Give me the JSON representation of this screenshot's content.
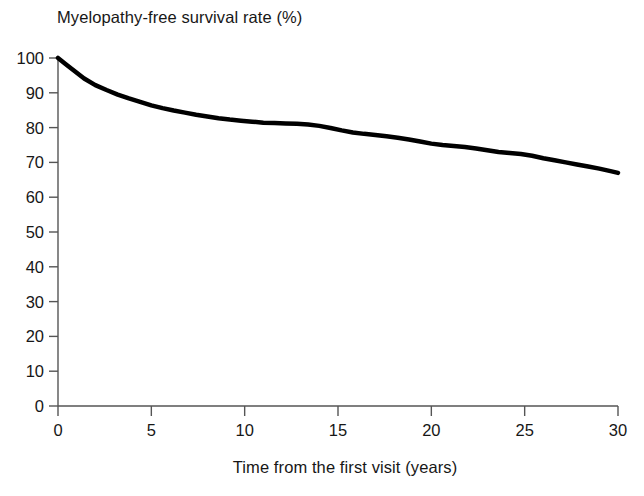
{
  "chart_data": {
    "type": "line",
    "title": "Myelopathy-free survival rate (%)",
    "subtitle": "",
    "xlabel": "Time from the first visit (years)",
    "ylabel": "",
    "xlim": [
      0,
      30
    ],
    "ylim": [
      0,
      100
    ],
    "grid": false,
    "legend": null,
    "legend_position": "none",
    "xticks": [
      0,
      5,
      10,
      15,
      20,
      25,
      30
    ],
    "xtick_labels": [
      "0",
      "5",
      "10",
      "15",
      "20",
      "25",
      "30"
    ],
    "yticks": [
      0,
      10,
      20,
      30,
      40,
      50,
      60,
      70,
      80,
      90,
      100
    ],
    "ytick_labels": [
      "0",
      "10",
      "20",
      "30",
      "40",
      "50",
      "60",
      "70",
      "80",
      "90",
      "100"
    ],
    "line_color": "#000000",
    "line_width": 4.5,
    "series": [
      {
        "name": "Myelopathy-free survival",
        "x": [
          0.0,
          0.4,
          0.9,
          1.4,
          2.0,
          2.6,
          3.2,
          3.8,
          4.4,
          5.0,
          5.6,
          6.2,
          6.8,
          7.4,
          8.0,
          8.6,
          9.2,
          9.8,
          10.4,
          11.0,
          11.6,
          12.2,
          12.8,
          13.4,
          14.0,
          14.6,
          15.2,
          15.8,
          16.4,
          17.0,
          17.6,
          18.2,
          18.8,
          19.4,
          20.0,
          20.6,
          21.2,
          21.8,
          22.4,
          23.0,
          23.6,
          24.2,
          24.8,
          25.4,
          26.0,
          26.6,
          27.2,
          27.8,
          28.4,
          29.0,
          29.6,
          30.0
        ],
        "y": [
          100.0,
          98.3,
          96.2,
          94.1,
          92.2,
          90.8,
          89.5,
          88.4,
          87.4,
          86.4,
          85.6,
          84.9,
          84.3,
          83.7,
          83.2,
          82.7,
          82.3,
          82.0,
          81.7,
          81.4,
          81.3,
          81.2,
          81.1,
          80.9,
          80.5,
          79.9,
          79.2,
          78.6,
          78.2,
          77.9,
          77.5,
          77.1,
          76.6,
          76.0,
          75.4,
          75.0,
          74.7,
          74.4,
          74.0,
          73.5,
          73.0,
          72.7,
          72.4,
          71.9,
          71.2,
          70.6,
          70.0,
          69.4,
          68.8,
          68.2,
          67.5,
          67.0
        ]
      }
    ],
    "axis": {
      "x_start_px": 58,
      "x_end_px": 618,
      "y_top_px": 58,
      "y_bottom_px": 406
    }
  }
}
